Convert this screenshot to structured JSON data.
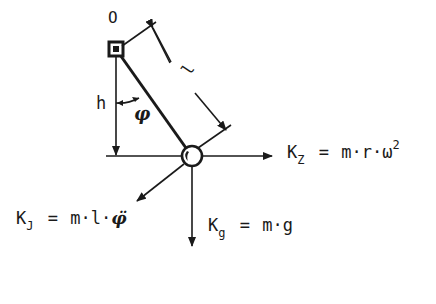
{
  "diagram": {
    "type": "pendulum-force-diagram",
    "colors": {
      "ink": "#1a1a1a",
      "background": "#ffffff"
    },
    "pivot": {
      "label": "O"
    },
    "length": {
      "label": "l"
    },
    "height": {
      "label": "h"
    },
    "angle": {
      "label": "φ"
    },
    "forces": {
      "centrifugal": {
        "symbol": "K",
        "subscript": "Z",
        "equals": "=",
        "expr": "m·r·ω",
        "power": "2"
      },
      "gravity": {
        "symbol": "K",
        "subscript": "g",
        "equals": "=",
        "expr": "m·g"
      },
      "inertia": {
        "symbol": "K",
        "subscript": "J",
        "equals": "=",
        "expr": "m·l·",
        "accel": "φ̈"
      }
    }
  }
}
